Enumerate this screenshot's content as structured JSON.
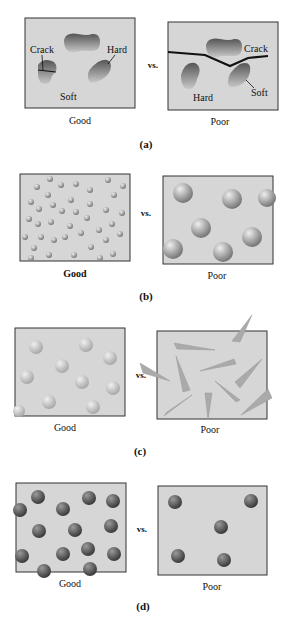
{
  "panels": [
    {
      "id": "a",
      "caption": "(a)",
      "vs": "vs.",
      "good": "Good",
      "poor": "Poor",
      "labels": {
        "good_crack": "Crack",
        "good_hard": "Hard",
        "good_soft": "Soft",
        "poor_crack": "Crack",
        "poor_hard": "Hard",
        "poor_soft": "Soft"
      }
    },
    {
      "id": "b",
      "caption": "(b)",
      "vs": "vs.",
      "good": "Good",
      "poor": "Poor"
    },
    {
      "id": "c",
      "caption": "(c)",
      "vs": "vs.",
      "good": "Good",
      "poor": "Poor"
    },
    {
      "id": "d",
      "caption": "(d)",
      "vs": "vs.",
      "good": "Good",
      "poor": "Poor"
    }
  ],
  "colors": {
    "box_fill": "#d6d6d6",
    "box_border": "#333333",
    "light_particle": "#c8c8c8",
    "dark_particle": "#555555"
  }
}
